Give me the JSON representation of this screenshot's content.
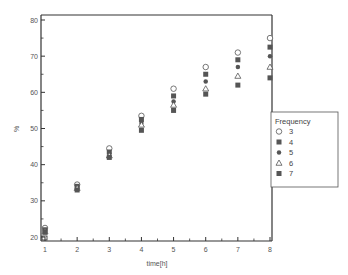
{
  "chart_data": {
    "type": "scatter",
    "title": "",
    "xlabel": "time[h]",
    "ylabel": "%",
    "x": [
      1,
      2,
      3,
      4,
      5,
      6,
      7,
      8
    ],
    "xlim": [
      0.9,
      8.1
    ],
    "ylim": [
      19,
      81
    ],
    "xticks": [
      1,
      2,
      3,
      4,
      5,
      6,
      7,
      8
    ],
    "yticks": [
      20,
      30,
      40,
      50,
      60,
      70,
      80
    ],
    "grid": false,
    "legend": {
      "title": "Frequency",
      "position": "right-outside"
    },
    "series": [
      {
        "name": "3",
        "marker": "open-circle",
        "values": [
          22.5,
          34.5,
          44.5,
          53.5,
          61,
          67,
          71,
          75
        ]
      },
      {
        "name": "4",
        "marker": "filled-square",
        "values": [
          22,
          34,
          43.5,
          52.5,
          59,
          65,
          69,
          72.5
        ]
      },
      {
        "name": "5",
        "marker": "filled-circle",
        "values": [
          21.8,
          33.8,
          43,
          51.5,
          57.5,
          63,
          67,
          70
        ]
      },
      {
        "name": "6",
        "marker": "open-triangle",
        "values": [
          21.5,
          33.5,
          42.5,
          51,
          56.5,
          61,
          64.5,
          67
        ]
      },
      {
        "name": "7",
        "marker": "filled-square",
        "values": [
          21.3,
          33,
          42,
          49.5,
          55,
          59.5,
          62,
          64
        ]
      }
    ]
  },
  "axis": {
    "x_label": "time[h]",
    "y_label": "%"
  },
  "legend": {
    "title": "Frequency",
    "items": [
      "3",
      "4",
      "5",
      "6",
      "7"
    ]
  },
  "colors": {
    "axis": "#333333",
    "marker": "#555555",
    "text": "#555555"
  }
}
